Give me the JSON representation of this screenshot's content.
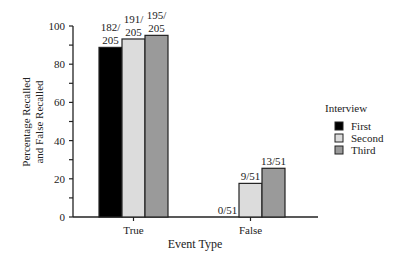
{
  "chart_data": {
    "type": "bar",
    "title": "",
    "xlabel": "Event Type",
    "ylabel": "Percentage Recalled and False Recalled",
    "ylabel_lines": [
      "Percentage Recalled",
      "and False Recalled"
    ],
    "ylim": [
      0,
      100
    ],
    "yticks": [
      0,
      20,
      40,
      60,
      80,
      100
    ],
    "categories": [
      "True",
      "False"
    ],
    "series": [
      {
        "name": "First",
        "color": "#000000",
        "values": [
          88.8,
          0.0
        ],
        "labels": [
          "182/205",
          "0/51"
        ]
      },
      {
        "name": "Second",
        "color": "#dcdcdc",
        "values": [
          93.2,
          17.6
        ],
        "labels": [
          "191/205",
          "9/51"
        ]
      },
      {
        "name": "Third",
        "color": "#9a9a9a",
        "values": [
          95.1,
          25.5
        ],
        "labels": [
          "195/205",
          "13/51"
        ]
      }
    ],
    "legend": {
      "title": "Interview",
      "position": "right",
      "entries": [
        "First",
        "Second",
        "Third"
      ]
    },
    "grid": false
  }
}
